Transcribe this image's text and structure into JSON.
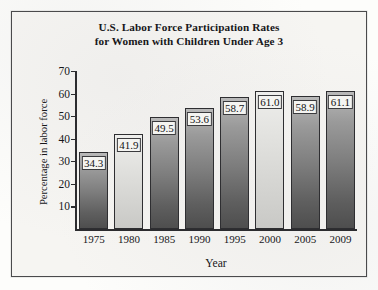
{
  "chart_data": {
    "type": "bar",
    "title": "U.S. Labor Force Participation Rates for Women with Children Under Age 3",
    "title_lines": [
      "U.S. Labor Force Participation Rates",
      "for Women with Children Under Age 3"
    ],
    "xlabel": "Year",
    "ylabel": "Percentage in labor force",
    "categories": [
      "1975",
      "1980",
      "1985",
      "1990",
      "1995",
      "2000",
      "2005",
      "2009"
    ],
    "values": [
      34.3,
      41.9,
      49.5,
      53.6,
      58.7,
      61.0,
      58.9,
      61.1
    ],
    "value_labels": [
      "34.3",
      "41.9",
      "49.5",
      "53.6",
      "58.7",
      "61.0",
      "58.9",
      "61.1"
    ],
    "bar_shades": [
      "dark",
      "light",
      "dark",
      "dark",
      "dark",
      "light",
      "dark",
      "dark"
    ],
    "ylim": [
      0,
      70
    ],
    "yticks": [
      70,
      60,
      50,
      40,
      30,
      20,
      10
    ],
    "ytick_labels": [
      "70",
      "60",
      "50",
      "40",
      "30",
      "20",
      "10"
    ],
    "grid": false,
    "legend": null
  },
  "colors": {
    "frame_border": "#4a4a4c",
    "figure_background": "#f6f5f2",
    "axis": "#2c2c2f",
    "text": "#17171a",
    "bar_outline": "#2e2e31",
    "bar_dark_top": "#b9b9b9",
    "bar_dark_bottom": "#4e4e4e",
    "bar_light_top": "#eeeeec",
    "bar_light_bottom": "#c9c9c6"
  }
}
